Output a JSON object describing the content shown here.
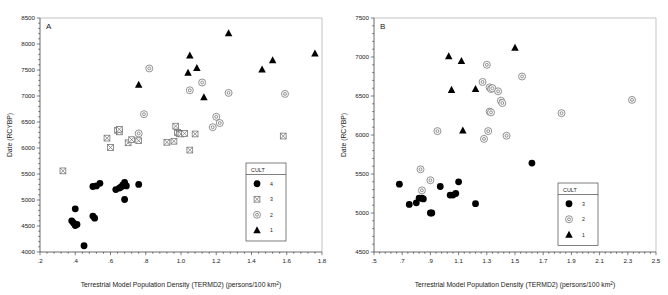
{
  "figure": {
    "panels": [
      {
        "letter": "A",
        "xlabel": "Terrestrial Model Population Density (TERMD2) (persons/100 km²)",
        "ylabel": "Date (RCYBP)",
        "xticks": [
          ".2",
          ".4",
          ".6",
          ".8",
          "1.0",
          "1.2",
          "1.4",
          "1.6",
          "1.8"
        ],
        "xtickvals": [
          0.2,
          0.4,
          0.6,
          0.8,
          1.0,
          1.2,
          1.4,
          1.6,
          1.8
        ],
        "yticks": [
          "4000",
          "4500",
          "5000",
          "5500",
          "6000",
          "6500",
          "7000",
          "7500",
          "8000",
          "8500"
        ],
        "ytickvals": [
          4000,
          4500,
          5000,
          5500,
          6000,
          6500,
          7000,
          7500,
          8000,
          8500
        ],
        "legend": {
          "title": "CULT",
          "entries": [
            {
              "label": "4",
              "marker": "filled-circle"
            },
            {
              "label": "3",
              "marker": "crossed-square"
            },
            {
              "label": "2",
              "marker": "target-circle"
            },
            {
              "label": "1",
              "marker": "filled-triangle"
            }
          ]
        }
      },
      {
        "letter": "B",
        "xlabel": "Terrestrial Model Population Density (TERMD2) (persons/100 km²)",
        "ylabel": "Date (RCYBP)",
        "xticks": [
          ".5",
          ".7",
          ".9",
          "1.1",
          "1.3",
          "1.5",
          "1.7",
          "1.9",
          "2.1",
          "2.3",
          "2.5"
        ],
        "xtickvals": [
          0.5,
          0.7,
          0.9,
          1.1,
          1.3,
          1.5,
          1.7,
          1.9,
          2.1,
          2.3,
          2.5
        ],
        "yticks": [
          "4500",
          "5000",
          "5500",
          "6000",
          "6500",
          "7000",
          "7500"
        ],
        "ytickvals": [
          4500,
          5000,
          5500,
          6000,
          6500,
          7000,
          7500
        ],
        "legend": {
          "title": "CULT",
          "entries": [
            {
              "label": "3",
              "marker": "filled-circle"
            },
            {
              "label": "2",
              "marker": "target-circle"
            },
            {
              "label": "1",
              "marker": "filled-triangle"
            }
          ]
        }
      }
    ]
  },
  "chart_data": [
    {
      "type": "scatter",
      "title": "A",
      "xlabel": "Terrestrial Model Population Density (TERMD2) (persons/100 km2)",
      "ylabel": "Date (RCYBP)",
      "xlim": [
        0.2,
        1.8
      ],
      "ylim": [
        4000,
        8500
      ],
      "grid": false,
      "legend_position": "lower-right",
      "legend_title": "CULT",
      "series": [
        {
          "name": "4",
          "marker": "filled-circle",
          "points": [
            [
              0.38,
              4600
            ],
            [
              0.39,
              4560
            ],
            [
              0.4,
              4830
            ],
            [
              0.4,
              4510
            ],
            [
              0.41,
              4530
            ],
            [
              0.45,
              4120
            ],
            [
              0.5,
              4690
            ],
            [
              0.51,
              4650
            ],
            [
              0.5,
              5260
            ],
            [
              0.52,
              5270
            ],
            [
              0.54,
              5320
            ],
            [
              0.63,
              5200
            ],
            [
              0.65,
              5230
            ],
            [
              0.66,
              5250
            ],
            [
              0.67,
              5290
            ],
            [
              0.68,
              5340
            ],
            [
              0.68,
              5010
            ],
            [
              0.69,
              5270
            ],
            [
              0.76,
              5300
            ]
          ]
        },
        {
          "name": "3",
          "marker": "crossed-square",
          "points": [
            [
              0.33,
              5560
            ],
            [
              0.58,
              6190
            ],
            [
              0.6,
              6010
            ],
            [
              0.64,
              6340
            ],
            [
              0.65,
              6310
            ],
            [
              0.65,
              6360
            ],
            [
              0.7,
              6100
            ],
            [
              0.72,
              6160
            ],
            [
              0.76,
              6140
            ],
            [
              0.92,
              6110
            ],
            [
              0.96,
              6130
            ],
            [
              0.97,
              6420
            ],
            [
              0.98,
              6300
            ],
            [
              0.99,
              6280
            ],
            [
              1.0,
              6270
            ],
            [
              1.02,
              6280
            ],
            [
              1.05,
              5960
            ],
            [
              1.08,
              6270
            ],
            [
              1.58,
              6230
            ]
          ]
        },
        {
          "name": "2",
          "marker": "target-circle",
          "points": [
            [
              0.82,
              7530
            ],
            [
              0.79,
              6650
            ],
            [
              0.76,
              6280
            ],
            [
              1.05,
              7110
            ],
            [
              1.12,
              7260
            ],
            [
              1.2,
              6600
            ],
            [
              1.18,
              6400
            ],
            [
              1.22,
              6480
            ],
            [
              1.27,
              7060
            ],
            [
              1.59,
              7040
            ]
          ]
        },
        {
          "name": "1",
          "marker": "filled-triangle",
          "points": [
            [
              0.76,
              7220
            ],
            [
              1.04,
              7450
            ],
            [
              1.05,
              7780
            ],
            [
              1.09,
              7540
            ],
            [
              1.13,
              6980
            ],
            [
              1.27,
              8210
            ],
            [
              1.46,
              7510
            ],
            [
              1.52,
              7690
            ],
            [
              1.76,
              7820
            ]
          ]
        }
      ]
    },
    {
      "type": "scatter",
      "title": "B",
      "xlabel": "Terrestrial Model Population Density (TERMD2) (persons/100 km2)",
      "ylabel": "Date (RCYBP)",
      "xlim": [
        0.5,
        2.5
      ],
      "ylim": [
        4500,
        7500
      ],
      "grid": false,
      "legend_position": "lower-right",
      "legend_title": "CULT",
      "series": [
        {
          "name": "3",
          "marker": "filled-circle",
          "points": [
            [
              0.68,
              5370
            ],
            [
              0.75,
              5110
            ],
            [
              0.8,
              5130
            ],
            [
              0.82,
              5190
            ],
            [
              0.84,
              5190
            ],
            [
              0.85,
              5180
            ],
            [
              0.9,
              5000
            ],
            [
              0.91,
              5000
            ],
            [
              0.97,
              5340
            ],
            [
              1.04,
              5230
            ],
            [
              1.06,
              5230
            ],
            [
              1.1,
              5400
            ],
            [
              1.08,
              5250
            ],
            [
              1.22,
              5120
            ],
            [
              1.62,
              5640
            ]
          ]
        },
        {
          "name": "2",
          "marker": "target-circle",
          "points": [
            [
              0.83,
              5560
            ],
            [
              0.84,
              5290
            ],
            [
              0.9,
              5420
            ],
            [
              0.95,
              6050
            ],
            [
              1.3,
              6900
            ],
            [
              1.27,
              6680
            ],
            [
              1.32,
              6610
            ],
            [
              1.33,
              6590
            ],
            [
              1.34,
              6600
            ],
            [
              1.38,
              6560
            ],
            [
              1.4,
              6440
            ],
            [
              1.41,
              6410
            ],
            [
              1.32,
              6300
            ],
            [
              1.33,
              6290
            ],
            [
              1.28,
              5950
            ],
            [
              1.31,
              6050
            ],
            [
              1.44,
              5990
            ],
            [
              1.55,
              6750
            ],
            [
              1.83,
              6280
            ],
            [
              2.33,
              6450
            ]
          ]
        },
        {
          "name": "1",
          "marker": "filled-triangle",
          "points": [
            [
              1.03,
              7010
            ],
            [
              1.12,
              6950
            ],
            [
              1.05,
              6580
            ],
            [
              1.22,
              6590
            ],
            [
              1.13,
              6060
            ],
            [
              1.5,
              7120
            ]
          ]
        }
      ]
    }
  ]
}
